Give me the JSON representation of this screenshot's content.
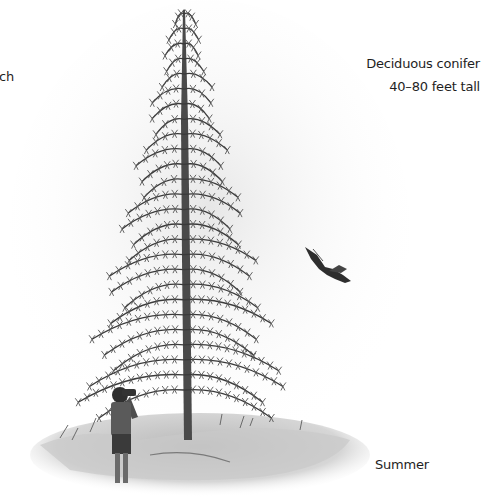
{
  "labels": {
    "title_fragment": "ch",
    "tree_type": "Deciduous conifer",
    "height_range": "40–80 feet tall",
    "season": "Summer"
  },
  "illustration": {
    "subject": "larch tree in summer foliage",
    "figures": [
      "person-with-binoculars",
      "flying-bird"
    ],
    "palette": {
      "ink": "#3a3a3a",
      "wash": "#bdbdbd",
      "light_wash": "#e6e6e6",
      "background": "#ffffff"
    }
  }
}
